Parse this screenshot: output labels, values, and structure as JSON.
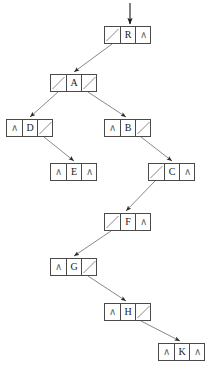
{
  "figure": {
    "type": "binary-tree-linked-representation",
    "null_glyph": "∧",
    "root_inbound_arrow": true,
    "caption": "",
    "colors": {
      "node_border": "#4a4a4a",
      "edge_line": "#7a7a7a",
      "text": "#1a1a1a",
      "null_glyph": "#6a6a6a",
      "background": "#ffffff"
    }
  },
  "nodes": [
    {
      "id": "R",
      "label": "R",
      "x": 104,
      "y": 26,
      "left": "slash",
      "right": "null",
      "left_child": "A",
      "right_child": null
    },
    {
      "id": "A",
      "label": "A",
      "x": 50,
      "y": 74,
      "left": "slash",
      "right": "slash",
      "left_child": "D",
      "right_child": "B"
    },
    {
      "id": "D",
      "label": "D",
      "x": 6,
      "y": 119,
      "left": "null",
      "right": "slash",
      "left_child": null,
      "right_child": "E"
    },
    {
      "id": "B",
      "label": "B",
      "x": 104,
      "y": 119,
      "left": "null",
      "right": "slash",
      "left_child": null,
      "right_child": "C"
    },
    {
      "id": "E",
      "label": "E",
      "x": 50,
      "y": 163,
      "left": "null",
      "right": "null",
      "left_child": null,
      "right_child": null
    },
    {
      "id": "C",
      "label": "C",
      "x": 148,
      "y": 163,
      "left": "slash",
      "right": "null",
      "left_child": "F",
      "right_child": null
    },
    {
      "id": "F",
      "label": "F",
      "x": 104,
      "y": 213,
      "left": "slash",
      "right": "null",
      "left_child": "G",
      "right_child": null
    },
    {
      "id": "G",
      "label": "G",
      "x": 50,
      "y": 258,
      "left": "null",
      "right": "slash",
      "left_child": null,
      "right_child": "H"
    },
    {
      "id": "H",
      "label": "H",
      "x": 104,
      "y": 303,
      "left": "null",
      "right": "slash",
      "left_child": null,
      "right_child": "K"
    },
    {
      "id": "K",
      "label": "K",
      "x": 158,
      "y": 343,
      "left": "null",
      "right": "null",
      "left_child": null,
      "right_child": null
    }
  ],
  "edges": [
    {
      "from": "R",
      "side": "left",
      "to": "A",
      "x1": 112,
      "y1": 44,
      "x2": 74,
      "y2": 72
    },
    {
      "from": "A",
      "side": "left",
      "to": "D",
      "x1": 58,
      "y1": 92,
      "x2": 30,
      "y2": 117
    },
    {
      "from": "A",
      "side": "right",
      "to": "B",
      "x1": 88,
      "y1": 92,
      "x2": 126,
      "y2": 117
    },
    {
      "from": "D",
      "side": "right",
      "to": "E",
      "x1": 44,
      "y1": 137,
      "x2": 74,
      "y2": 161
    },
    {
      "from": "B",
      "side": "right",
      "to": "C",
      "x1": 141,
      "y1": 137,
      "x2": 172,
      "y2": 161
    },
    {
      "from": "C",
      "side": "left",
      "to": "F",
      "x1": 155,
      "y1": 181,
      "x2": 126,
      "y2": 211
    },
    {
      "from": "F",
      "side": "left",
      "to": "G",
      "x1": 111,
      "y1": 231,
      "x2": 74,
      "y2": 256
    },
    {
      "from": "G",
      "side": "right",
      "to": "H",
      "x1": 88,
      "y1": 276,
      "x2": 126,
      "y2": 301
    },
    {
      "from": "H",
      "side": "right",
      "to": "K",
      "x1": 141,
      "y1": 321,
      "x2": 180,
      "y2": 341
    }
  ],
  "root_arrow": {
    "x": 130,
    "y_start": 3,
    "y_end": 24
  },
  "tree_structure": {
    "root": "R",
    "traversal_preorder": [
      "R",
      "A",
      "D",
      "E",
      "B",
      "C",
      "F",
      "G",
      "H",
      "K"
    ],
    "node_labels": [
      "R",
      "A",
      "D",
      "B",
      "E",
      "C",
      "F",
      "G",
      "H",
      "K"
    ]
  }
}
